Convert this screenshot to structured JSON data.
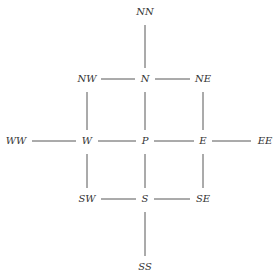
{
  "diagram": {
    "title": "",
    "line_color": "#444444",
    "text_color": "#333333",
    "nodes": [
      {
        "id": "NN",
        "label": "NN"
      },
      {
        "id": "NW",
        "label": "NW"
      },
      {
        "id": "N",
        "label": "N"
      },
      {
        "id": "NE",
        "label": "NE"
      },
      {
        "id": "WW",
        "label": "WW"
      },
      {
        "id": "W",
        "label": "W"
      },
      {
        "id": "P",
        "label": "P"
      },
      {
        "id": "E",
        "label": "E"
      },
      {
        "id": "EE",
        "label": "EE"
      },
      {
        "id": "SW",
        "label": "SW"
      },
      {
        "id": "S",
        "label": "S"
      },
      {
        "id": "SE",
        "label": "SE"
      },
      {
        "id": "SS",
        "label": "SS"
      }
    ],
    "edges": [
      {
        "from": "NN",
        "to": "N"
      },
      {
        "from": "NW",
        "to": "N"
      },
      {
        "from": "N",
        "to": "NE"
      },
      {
        "from": "NW",
        "to": "W"
      },
      {
        "from": "N",
        "to": "P"
      },
      {
        "from": "NE",
        "to": "E"
      },
      {
        "from": "WW",
        "to": "W"
      },
      {
        "from": "W",
        "to": "P"
      },
      {
        "from": "P",
        "to": "E"
      },
      {
        "from": "E",
        "to": "EE"
      },
      {
        "from": "W",
        "to": "SW"
      },
      {
        "from": "P",
        "to": "S"
      },
      {
        "from": "E",
        "to": "SE"
      },
      {
        "from": "SW",
        "to": "S"
      },
      {
        "from": "S",
        "to": "SE"
      },
      {
        "from": "S",
        "to": "SS"
      }
    ]
  }
}
